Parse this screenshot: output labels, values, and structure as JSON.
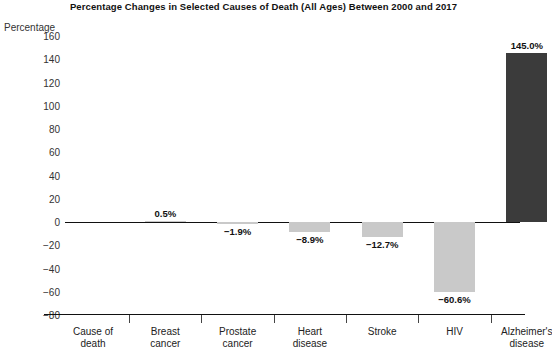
{
  "chart_data": {
    "type": "bar",
    "title": "Percentage Changes in Selected Causes of Death (All Ages) Between 2000 and 2017",
    "xlabel": "Cause of death",
    "ylabel": "Percentage",
    "categories": [
      "Breast cancer",
      "Prostate cancer",
      "Heart disease",
      "Stroke",
      "HIV",
      "Alzheimer's disease"
    ],
    "values": [
      0.5,
      -1.9,
      -8.9,
      -12.7,
      -60.6,
      145.0
    ],
    "value_labels": [
      "0.5%",
      "−1.9%",
      "−8.9%",
      "−12.7%",
      "−60.6%",
      "145.0%"
    ],
    "ylim": [
      -80,
      160
    ],
    "ytick_values": [
      160,
      140,
      120,
      100,
      80,
      60,
      40,
      20,
      0,
      -20,
      -40,
      -60,
      -80
    ],
    "ytick_labels": [
      "160",
      "140",
      "120",
      "100",
      "80",
      "60",
      "40",
      "20",
      "0",
      "−20",
      "−40",
      "−60",
      "−80"
    ],
    "grid": false,
    "legend": "none",
    "bar_colors": [
      "#c9c9c9",
      "#c9c9c9",
      "#c9c9c9",
      "#c9c9c9",
      "#c9c9c9",
      "#3b3b3b"
    ],
    "accent_color": "#3b3b3b",
    "secondary_color": "#c9c9c9",
    "axis_color": "#111111"
  },
  "xaxis": {
    "axis_title_lines": [
      "Cause of",
      "death"
    ],
    "category_lines": [
      [
        "Breast",
        "cancer"
      ],
      [
        "Prostate",
        "cancer"
      ],
      [
        "Heart",
        "disease"
      ],
      [
        "Stroke",
        ""
      ],
      [
        "HIV",
        ""
      ],
      [
        "Alzheimer's",
        "disease"
      ]
    ]
  }
}
